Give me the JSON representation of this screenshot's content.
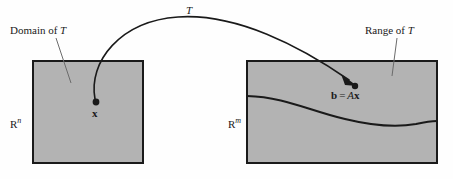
{
  "figure": {
    "colors": {
      "page_background": "#fefefe",
      "box_fill": "#b3b3b3",
      "box_stroke": "#1a1a1a",
      "curve_stroke": "#1a1a1a",
      "leader_stroke": "#555555",
      "text": "#1a1a1a"
    },
    "labels": {
      "domain_caption": "Domain of ",
      "domain_caption_italic": "T",
      "range_caption": "Range of ",
      "range_caption_italic": "T",
      "map_label": "T",
      "domain_space": "R",
      "domain_space_exponent": "n",
      "range_space": "R",
      "range_space_exponent": "m",
      "vector_x": "x",
      "image_b": "b",
      "image_equals": "=",
      "image_matrix": "A",
      "image_vector": "x"
    },
    "geometry": {
      "domain_box": {
        "x": 33,
        "y": 61,
        "width": 110,
        "height": 102
      },
      "range_box": {
        "x": 247,
        "y": 61,
        "width": 190,
        "height": 102
      },
      "x_point": {
        "x": 96,
        "y": 103
      },
      "b_point": {
        "x": 354,
        "y": 84
      },
      "arc_apex": {
        "x": 190,
        "y": 18
      }
    }
  }
}
